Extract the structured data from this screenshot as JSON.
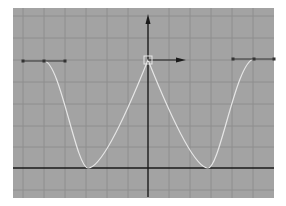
{
  "graph_editor": {
    "panel": {
      "x": 13,
      "y": 8,
      "width": 261,
      "height": 190,
      "background": "#a3a3a3"
    },
    "grid": {
      "color": "#8e8e8e",
      "vertical_lines_x": [
        23,
        44,
        65,
        86,
        107,
        128,
        169,
        190,
        211,
        232,
        253
      ],
      "horizontal_lines_y": [
        16,
        38,
        60,
        82,
        104,
        126,
        147,
        190
      ]
    },
    "axes": {
      "color": "#1a1a1a",
      "vertical_axis_x": 148,
      "vertical_axis_top": 14,
      "vertical_axis_bottom": 197,
      "horizontal_axis_y": 168
    },
    "curve": {
      "color": "#e6e6e6",
      "path": "M44,61 C60,61 76,168 88,168 C104,168 136,90 148,60 C160,90 192,168 208,168 C220,168 236,61 254,59"
    },
    "selected_key": {
      "x": 148,
      "y": 60,
      "size": 8,
      "color": "#e6e6e6"
    },
    "tangent_handle": {
      "x1": 148,
      "y1": 60,
      "x2": 186,
      "y2": 60,
      "color": "#1a1a1a"
    },
    "left_keys": {
      "line": {
        "x1": 23,
        "x2": 65,
        "y": 61
      },
      "points": [
        {
          "x": 23,
          "y": 61
        },
        {
          "x": 44,
          "y": 61
        },
        {
          "x": 65,
          "y": 61
        }
      ]
    },
    "right_keys": {
      "line": {
        "x1": 233,
        "x2": 274,
        "y": 59
      },
      "points": [
        {
          "x": 233,
          "y": 59
        },
        {
          "x": 254,
          "y": 59
        },
        {
          "x": 274,
          "y": 59
        }
      ]
    },
    "icons": {
      "up_arrow": "arrow-up-icon",
      "right_arrow": "arrow-right-icon"
    }
  }
}
